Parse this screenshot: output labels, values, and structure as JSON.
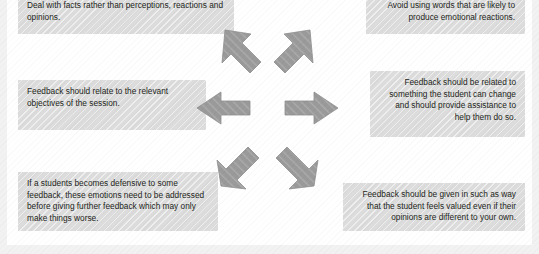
{
  "diagram": {
    "layout": "radial-six-arrow-burst",
    "colors": {
      "box_fill": "#dcdcdc",
      "arrow_fill": "#9a9a9a",
      "arrow_stroke": "#8e8e8e",
      "text": "#231f20",
      "page_background": "#ffffff",
      "margin_band": "#f2f2f2"
    },
    "callouts": [
      {
        "id": "top-left",
        "align": "left",
        "text": "Deal with facts rather than perceptions, reactions and opinions."
      },
      {
        "id": "top-right",
        "align": "right",
        "text": "Avoid using words that are likely to produce emotional reactions."
      },
      {
        "id": "middle-left",
        "align": "left",
        "text": "Feedback should relate to the relevant objectives of the session."
      },
      {
        "id": "middle-right",
        "align": "right",
        "text": "Feedback should be related to something the student can change and should provide assistance to help them do so."
      },
      {
        "id": "bottom-left",
        "align": "left",
        "text": "If a students becomes defensive to some feedback, these emotions need to be addressed before giving further feedback which may only make things worse."
      },
      {
        "id": "bottom-right",
        "align": "right",
        "text": "Feedback should be given in such as way that the student feels valued even if their opinions are different to your own."
      }
    ],
    "arrows": [
      {
        "id": "arrow-up-left",
        "direction": "up-left",
        "points_to": "top-left"
      },
      {
        "id": "arrow-up-right",
        "direction": "up-right",
        "points_to": "top-right"
      },
      {
        "id": "arrow-left",
        "direction": "left",
        "points_to": "middle-left"
      },
      {
        "id": "arrow-right",
        "direction": "right",
        "points_to": "middle-right"
      },
      {
        "id": "arrow-down-left",
        "direction": "down-left",
        "points_to": "bottom-left"
      },
      {
        "id": "arrow-down-right",
        "direction": "down-right",
        "points_to": "bottom-right"
      }
    ]
  }
}
